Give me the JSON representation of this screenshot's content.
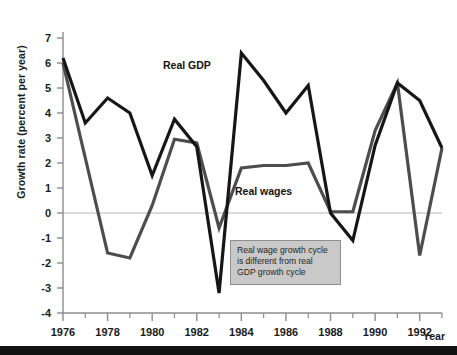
{
  "chart_data": {
    "type": "line",
    "title": "",
    "xlabel": "Year",
    "ylabel": "Growth rate (percent per year)",
    "xlim": [
      1976,
      1993
    ],
    "ylim": [
      -4,
      7
    ],
    "grid": false,
    "zero_line": true,
    "legend_position": "inline-annotations",
    "x_ticks": [
      "1976",
      "1978",
      "1980",
      "1982",
      "1984",
      "1986",
      "1988",
      "1990",
      "1992"
    ],
    "x_tick_values": [
      1976,
      1978,
      1980,
      1982,
      1984,
      1986,
      1988,
      1990,
      1992
    ],
    "x_minor_tick_values": [
      1977,
      1979,
      1981,
      1983,
      1985,
      1987,
      1989,
      1991,
      1993
    ],
    "y_ticks": [
      "7",
      "6",
      "5",
      "4",
      "3",
      "2",
      "1",
      "0",
      "-1",
      "-2",
      "-3",
      "-4"
    ],
    "y_tick_values": [
      7,
      6,
      5,
      4,
      3,
      2,
      1,
      0,
      -1,
      -2,
      -3,
      -4
    ],
    "x": [
      1976,
      1977,
      1978,
      1979,
      1980,
      1981,
      1982,
      1983,
      1984,
      1985,
      1986,
      1987,
      1988,
      1989,
      1990,
      1991,
      1992,
      1993
    ],
    "series": [
      {
        "name": "Real GDP",
        "color": "#161616",
        "width": 3.2,
        "values": [
          6.2,
          3.6,
          4.6,
          4.0,
          1.5,
          3.75,
          2.65,
          -3.2,
          6.4,
          5.3,
          4.0,
          5.1,
          0.0,
          -1.1,
          2.7,
          5.2,
          4.5,
          2.6
        ]
      },
      {
        "name": "Real wages",
        "color": "#4d4d4d",
        "width": 3.2,
        "values": [
          6.0,
          2.2,
          -1.6,
          -1.8,
          0.3,
          2.95,
          2.8,
          -0.6,
          1.8,
          1.9,
          1.9,
          2.0,
          0.05,
          0.05,
          3.3,
          5.2,
          -1.7,
          2.6
        ]
      }
    ],
    "annotations": [
      {
        "name": "real-gdp-label",
        "text": "Real GDP"
      },
      {
        "name": "real-wages-label",
        "text": "Real wages"
      }
    ],
    "callout": {
      "line1": "Real wage growth cycle",
      "line2": "is different from real",
      "line3": "GDP growth cycle",
      "bg_color": "#c9c9c9",
      "border_color": "#8e8e8e"
    }
  },
  "axis": {
    "y_title": "Growth rate (percent per year)",
    "x_title": "Year"
  },
  "colors": {
    "gdp": "#161616",
    "wages": "#4d4d4d",
    "zero_line": "#b5b5b5",
    "axis": "#8c8c8c",
    "background": "#ffffff",
    "footer_rule": "#111111"
  }
}
